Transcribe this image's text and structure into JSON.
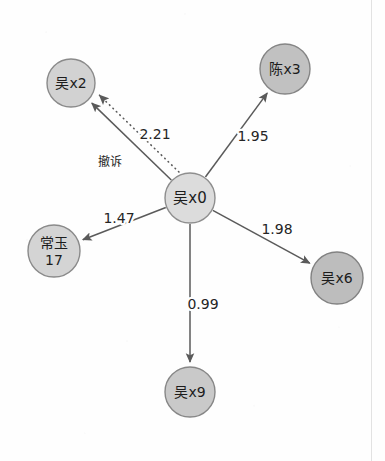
{
  "diagram": {
    "type": "ego-network-graph",
    "background_color": "#fefefe",
    "edge_color": "#5a5a5a",
    "label_color": "#1c1c1c",
    "center_node_id": "n0",
    "nodes": [
      {
        "id": "n0",
        "label": "吴x0",
        "label_lines": [
          "吴x0"
        ],
        "cx": 190,
        "cy": 198,
        "r": 25,
        "fill": "#dcdcdc",
        "stroke": "#8e8e8e",
        "font_size": 15,
        "role": "center"
      },
      {
        "id": "n2",
        "label": "吴x2",
        "label_lines": [
          "吴x2"
        ],
        "cx": 71,
        "cy": 83,
        "r": 24,
        "fill": "#d2d2d2",
        "stroke": "#8a8a8a",
        "font_size": 14,
        "role": "peripheral"
      },
      {
        "id": "n3",
        "label": "陈x3",
        "label_lines": [
          "陈x3"
        ],
        "cx": 285,
        "cy": 69,
        "r": 25,
        "fill": "#c1c1c1",
        "stroke": "#858585",
        "font_size": 14,
        "role": "peripheral"
      },
      {
        "id": "n17",
        "label": "常玉 17",
        "label_lines": [
          "常玉",
          "17"
        ],
        "cx": 54,
        "cy": 251,
        "r": 26,
        "fill": "#d4d4d4",
        "stroke": "#8a8a8a",
        "font_size": 14,
        "role": "peripheral"
      },
      {
        "id": "n6",
        "label": "吴x6",
        "label_lines": [
          "吴x6"
        ],
        "cx": 337,
        "cy": 278,
        "r": 26,
        "fill": "#bdbdbd",
        "stroke": "#828282",
        "font_size": 14,
        "role": "peripheral"
      },
      {
        "id": "n9",
        "label": "吴x9",
        "label_lines": [
          "吴x9"
        ],
        "cx": 190,
        "cy": 392,
        "r": 25,
        "fill": "#c9c9c9",
        "stroke": "#878787",
        "font_size": 14,
        "role": "peripheral"
      }
    ],
    "edges": [
      {
        "id": "e-n0-n2",
        "source": "n0",
        "target": "n2",
        "label": "2.21",
        "style": "solid",
        "directed": true,
        "label_x": 155,
        "label_y": 134,
        "font_size": 14
      },
      {
        "id": "e-n0-n2-dotted",
        "source": "n0",
        "target": "n2",
        "label": "撤诉",
        "style": "dotted",
        "directed": true,
        "label_x": 110,
        "label_y": 162,
        "font_size": 12
      },
      {
        "id": "e-n0-n3",
        "source": "n0",
        "target": "n3",
        "label": "1.95",
        "style": "solid",
        "directed": true,
        "label_x": 253,
        "label_y": 136,
        "font_size": 14
      },
      {
        "id": "e-n0-n17",
        "source": "n0",
        "target": "n17",
        "label": "1.47",
        "style": "solid",
        "directed": true,
        "label_x": 119,
        "label_y": 218,
        "font_size": 14
      },
      {
        "id": "e-n0-n6",
        "source": "n0",
        "target": "n6",
        "label": "1.98",
        "style": "solid",
        "directed": true,
        "label_x": 277,
        "label_y": 229,
        "font_size": 14
      },
      {
        "id": "e-n0-n9",
        "source": "n0",
        "target": "n9",
        "label": "0.99",
        "style": "solid",
        "directed": true,
        "label_x": 203,
        "label_y": 304,
        "font_size": 14
      }
    ]
  }
}
